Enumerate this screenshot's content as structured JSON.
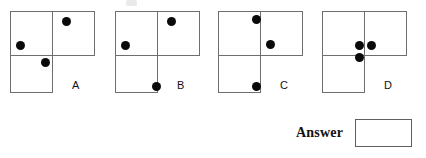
{
  "puzzle": {
    "type": "visual-analogy-dot-pattern",
    "dot_color": "#0a0a0a",
    "outline_color": "#6e6e6e",
    "background": "#ffffff",
    "shape_description": "L-shaped tromino made of a top-left square, a top-right square and a bottom-left square",
    "cells": [
      {
        "name": "top-left",
        "x": 0,
        "y": 11,
        "w": 43,
        "h": 45
      },
      {
        "name": "top-right",
        "x": 42,
        "y": 11,
        "w": 43,
        "h": 45
      },
      {
        "name": "bottom-left",
        "x": 0,
        "y": 55,
        "w": 43,
        "h": 38
      }
    ],
    "figures": [
      {
        "id": "a",
        "label": "A",
        "label_x": 62,
        "label_y": 80,
        "dots": [
          {
            "name": "dot-top-right-cell",
            "x": 52,
            "y": 17
          },
          {
            "name": "dot-left-lower-top-left-cell",
            "x": 6,
            "y": 41
          },
          {
            "name": "dot-bottom-left-cell-upper",
            "x": 31,
            "y": 58
          }
        ]
      },
      {
        "id": "b",
        "label": "B",
        "label_x": 62,
        "label_y": 80,
        "dots": [
          {
            "name": "dot-top-right-cell",
            "x": 52,
            "y": 17
          },
          {
            "name": "dot-left-lower-top-left-cell",
            "x": 6,
            "y": 41
          },
          {
            "name": "dot-bottom-left-cell-lower-right",
            "x": 37,
            "y": 82
          }
        ]
      },
      {
        "id": "c",
        "label": "C",
        "label_x": 62,
        "label_y": 80,
        "dots": [
          {
            "name": "dot-top-left-cell-upper-right",
            "x": 34,
            "y": 15
          },
          {
            "name": "dot-top-right-cell-lower-left",
            "x": 48,
            "y": 40
          },
          {
            "name": "dot-bottom-left-cell-lower-right",
            "x": 34,
            "y": 82
          }
        ]
      },
      {
        "id": "d",
        "label": "D",
        "label_x": 62,
        "label_y": 80,
        "dots": [
          {
            "name": "dot-center-left",
            "x": 33,
            "y": 41
          },
          {
            "name": "dot-center-right",
            "x": 45,
            "y": 41
          },
          {
            "name": "dot-below-center",
            "x": 33,
            "y": 53
          }
        ]
      }
    ]
  },
  "answer": {
    "label": "Answer",
    "value": "",
    "box_name": "answer-input-box"
  }
}
